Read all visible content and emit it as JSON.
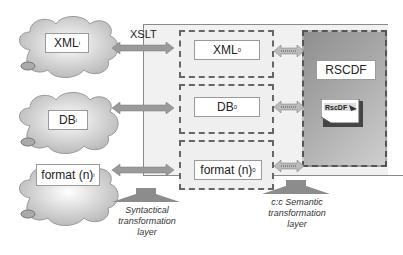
{
  "diagram": {
    "sources": [
      {
        "id": "xml",
        "label": "XML",
        "subscript": "i"
      },
      {
        "id": "db",
        "label": "DB",
        "subscript": "i"
      },
      {
        "id": "format",
        "label": "format (n)",
        "subscript": "i"
      }
    ],
    "transform_label": "XSLT",
    "intermediates": [
      {
        "id": "xml0",
        "label": "XML",
        "superscript": "0"
      },
      {
        "id": "db0",
        "label": "DB",
        "superscript": "0"
      },
      {
        "id": "format0",
        "label": "format (n)",
        "subscript": "0"
      }
    ],
    "target": {
      "label": "RSCDF",
      "logo_text": "RscDF"
    },
    "layers": [
      {
        "id": "syntactical",
        "lines": [
          "Syntactical",
          "transformation",
          "layer"
        ]
      },
      {
        "id": "semantic",
        "lines": [
          "c:c Semantic",
          "transformation",
          "layer"
        ]
      }
    ],
    "colors": {
      "panel": "#f1f1f1",
      "dashed": "#666666",
      "rscdf_bg": "#a0a0a0",
      "arrow": "#8c8c8c"
    }
  }
}
